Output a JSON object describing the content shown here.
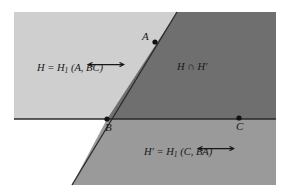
{
  "figure": {
    "background_color": "#ffffff",
    "regions": {
      "H_fill": "#cfcfcf",
      "H_prime_fill": "#9a9a9a",
      "intersection_fill": "#6f6f6f",
      "line_color": "#2a2a2a"
    },
    "labels": {
      "left_region": {
        "prefix": "H = H",
        "subscript": "1",
        "open": " (",
        "arg1": "A",
        "comma": ", ",
        "arg2": "BC",
        "close": ")",
        "arrow": "double-headed-arrow"
      },
      "middle_region": {
        "text": "H ∩ H′"
      },
      "bottom_region": {
        "prefix": "H′ = H",
        "subscript": "1",
        "open": " (",
        "arg1": "C",
        "comma": ", ",
        "arg2": "BA",
        "close": ")",
        "arrow": "double-headed-arrow"
      }
    },
    "points": [
      {
        "name": "A",
        "label": "A",
        "x": 155,
        "y": 42
      },
      {
        "name": "B",
        "label": "B",
        "x": 107,
        "y": 119
      },
      {
        "name": "C",
        "label": "C",
        "x": 239,
        "y": 118
      }
    ],
    "lines": [
      {
        "name": "line-BC",
        "x1": 14,
        "y1": 119,
        "x2": 276,
        "y2": 119
      },
      {
        "name": "line-BA",
        "x1": 72,
        "y1": 185,
        "x2": 177,
        "y2": 12
      }
    ]
  }
}
